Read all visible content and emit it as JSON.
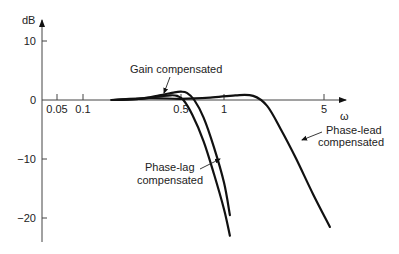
{
  "chart_data": {
    "type": "line",
    "title": "",
    "xlabel": "ω",
    "ylabel": "dB",
    "x_scale": "log",
    "x_ticks": [
      {
        "value": 0.05,
        "label": "0.05"
      },
      {
        "value": 0.1,
        "label": "0.1"
      },
      {
        "value": 0.5,
        "label": "0.5"
      },
      {
        "value": 1,
        "label": "1"
      },
      {
        "value": 5,
        "label": "5"
      }
    ],
    "y_ticks": [
      {
        "value": 10,
        "label": "10"
      },
      {
        "value": 0,
        "label": "0"
      },
      {
        "value": -10,
        "label": "-10"
      },
      {
        "value": -20,
        "label": "-20"
      }
    ],
    "ylim": [
      -24,
      12
    ],
    "grid": false,
    "legend": "none",
    "series": [
      {
        "name": "Gain compensated",
        "x": [
          0.16,
          0.25,
          0.35,
          0.45,
          0.5,
          0.55,
          0.62,
          0.72,
          0.85,
          1.0,
          1.1
        ],
        "y": [
          0,
          0.2,
          0.8,
          1.3,
          1.4,
          1.2,
          0,
          -3,
          -8,
          -14,
          -19.5
        ]
      },
      {
        "name": "Phase-lag compensated",
        "x": [
          0.16,
          0.25,
          0.35,
          0.42,
          0.47,
          0.52,
          0.6,
          0.72,
          0.85,
          1.0,
          1.1
        ],
        "y": [
          0,
          0.2,
          0.6,
          0.8,
          0.7,
          0,
          -2.5,
          -7,
          -12.5,
          -18.5,
          -23
        ]
      },
      {
        "name": "Phase-lead compensated",
        "x": [
          0.16,
          0.3,
          0.5,
          0.8,
          1.2,
          1.6,
          2.0,
          2.5,
          3.2,
          4.2,
          5.5
        ],
        "y": [
          0,
          0.3,
          0.2,
          0.4,
          0.8,
          0.7,
          -1,
          -5,
          -10,
          -16,
          -21.5
        ]
      }
    ],
    "annotations": [
      {
        "text": "Gain compensated",
        "target_series": "Gain compensated"
      },
      {
        "text_lines": [
          "Phase-lag",
          "compensated"
        ],
        "target_series": "Phase-lag compensated"
      },
      {
        "text_lines": [
          "Phase-lead",
          "compensated"
        ],
        "target_series": "Phase-lead compensated"
      }
    ]
  }
}
